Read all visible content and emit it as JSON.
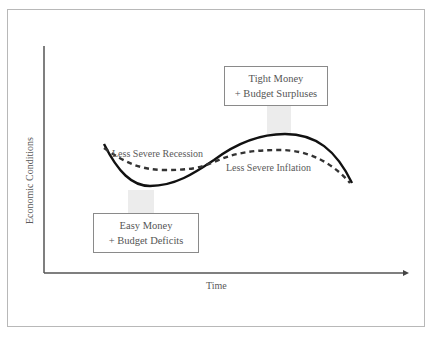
{
  "diagram": {
    "y_axis_label": "Economic Conditions",
    "x_axis_label": "Time",
    "boxes": {
      "top": {
        "line1": "Tight Money",
        "line2": "+ Budget Surpluses"
      },
      "bottom": {
        "line1": "Easy Money",
        "line2": "+ Budget Deficits"
      }
    },
    "curve_labels": {
      "recession": "Less Severe Recession",
      "inflation": "Less Severe Inflation"
    },
    "series": [
      {
        "name": "Business cycle (without policy)",
        "style": "solid",
        "color": "#111111"
      },
      {
        "name": "Business cycle (with policy)",
        "style": "dashed",
        "color": "#333333"
      }
    ],
    "colors": {
      "arrow_fill": "#ececec",
      "frame": "#b8b8b8",
      "axis": "#444444"
    }
  }
}
